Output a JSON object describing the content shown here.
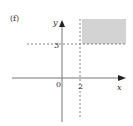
{
  "figure": {
    "part_label": "(f)",
    "x_axis_label": "x",
    "y_axis_label": "y",
    "origin_label": "0",
    "x_tick_label": "2",
    "y_tick_label": "3",
    "shaded_region": "x ≥ 2 and y ≥ 3",
    "colors": {
      "axis": "#777777",
      "dashed": "#666666",
      "shade": "#d3d3d3",
      "text": "#333333"
    }
  }
}
